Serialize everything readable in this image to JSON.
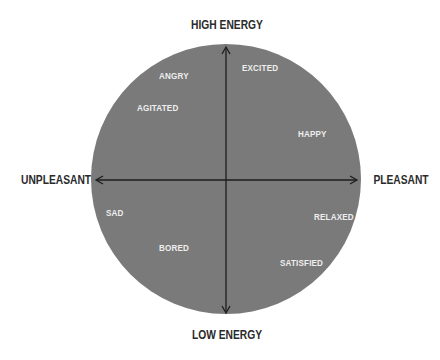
{
  "diagram": {
    "type": "circumplex-mood-meter",
    "colors": {
      "circle_fill": "#7a7a7a",
      "axis_line": "#1e1e1e",
      "axis_label": "#2a2a2a",
      "emotion_label": "#eeeeee",
      "background": "#ffffff"
    },
    "axes": {
      "top": "HIGH ENERGY",
      "bottom": "LOW ENERGY",
      "left": "UNPLEASANT",
      "right": "PLEASANT"
    },
    "emotions": [
      {
        "label": "EXCITED",
        "quadrant": "high-energy-pleasant"
      },
      {
        "label": "ANGRY",
        "quadrant": "high-energy-unpleasant"
      },
      {
        "label": "AGITATED",
        "quadrant": "high-energy-unpleasant"
      },
      {
        "label": "HAPPY",
        "quadrant": "high-energy-pleasant"
      },
      {
        "label": "SAD",
        "quadrant": "low-energy-unpleasant"
      },
      {
        "label": "RELAXED",
        "quadrant": "low-energy-pleasant"
      },
      {
        "label": "BORED",
        "quadrant": "low-energy-unpleasant"
      },
      {
        "label": "SATISFIED",
        "quadrant": "low-energy-pleasant"
      }
    ]
  }
}
